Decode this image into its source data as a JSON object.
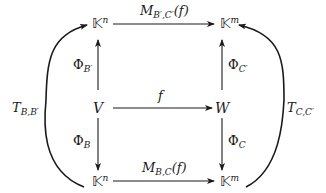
{
  "nodes": {
    "top_left": {
      "base": "𝕂",
      "sup": "n"
    },
    "top_right": {
      "base": "𝕂",
      "sup": "m"
    },
    "mid_left": {
      "base": "V"
    },
    "mid_right": {
      "base": "W"
    },
    "bottom_left": {
      "base": "𝕂",
      "sup": "n"
    },
    "bottom_right": {
      "base": "𝕂",
      "sup": "m"
    }
  },
  "arrows": {
    "top": {
      "main": "M",
      "sub": "B′,C′",
      "arg": "(f)"
    },
    "middle": {
      "main": "f"
    },
    "bottom": {
      "main": "M",
      "sub": "B,C",
      "arg": "(f)"
    },
    "left_up": {
      "main": "Φ",
      "sub": "B′"
    },
    "left_down": {
      "main": "Φ",
      "sub": "B"
    },
    "right_up": {
      "main": "Φ",
      "sub": "C′"
    },
    "right_down": {
      "main": "Φ",
      "sub": "C"
    },
    "left_curve": {
      "main": "T",
      "sub": "B,B′"
    },
    "right_curve": {
      "main": "T",
      "sub": "C,C′"
    }
  },
  "colors": {
    "stroke": "#1a1a1a",
    "background": "#ffffff"
  }
}
